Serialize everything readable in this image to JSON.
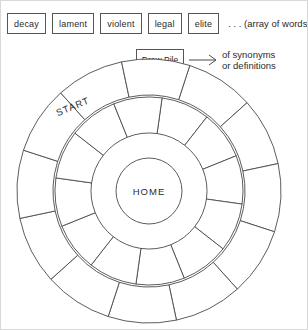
{
  "diagram": {
    "stroke_color": "#4a4a4a",
    "background_color": "#ffffff"
  },
  "word_array": {
    "cards": [
      {
        "label": "decay"
      },
      {
        "label": "lament"
      },
      {
        "label": "violent"
      },
      {
        "label": "legal"
      },
      {
        "label": "elite"
      }
    ],
    "note": ". . . (array of words)"
  },
  "draw_pile": {
    "card_label": "Draw Pile",
    "arrow": "right-arrow",
    "note_line1": "of synonyms",
    "note_line2": "or definitions"
  },
  "board": {
    "start_label": "START",
    "home_label": "HOME",
    "center": {
      "x": 148,
      "y": 190
    },
    "rings": [
      {
        "name": "outer-ring",
        "inner_radius": 96,
        "outer_radius": 132,
        "segments": 12
      },
      {
        "name": "middle-ring",
        "inner_radius": 58,
        "outer_radius": 94,
        "segments": 12
      },
      {
        "name": "home-circle",
        "radius": 33
      }
    ]
  }
}
